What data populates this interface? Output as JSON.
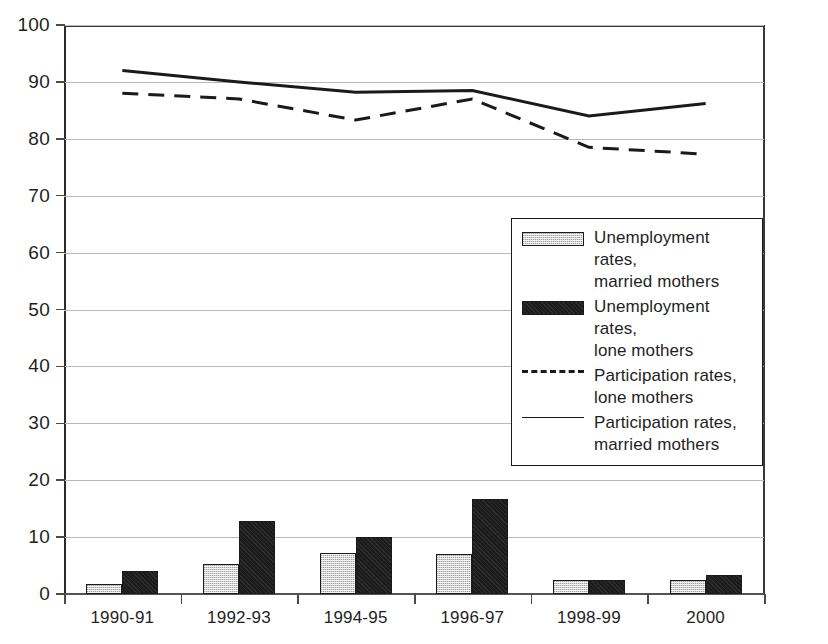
{
  "chart_data": {
    "type": "bar",
    "title": "",
    "subtitle": "",
    "xlabel": "",
    "ylabel": "",
    "ylim": [
      0,
      100
    ],
    "ytick_labels": [
      "0",
      "10",
      "20",
      "30",
      "40",
      "50",
      "60",
      "70",
      "80",
      "90",
      "100"
    ],
    "ytick_values": [
      0,
      10,
      20,
      30,
      40,
      50,
      60,
      70,
      80,
      90,
      100
    ],
    "grid": true,
    "grid_axis": "y",
    "legend_position": "center-right",
    "categories": [
      "1990-91",
      "1992-93",
      "1994-95",
      "1996-97",
      "1998-99",
      "2000"
    ],
    "series": [
      {
        "name": "Unemployment rates, married mothers",
        "kind": "bar",
        "style": "light-hatched",
        "color": "#d4d4d4",
        "values": [
          1.7,
          5.2,
          7.2,
          7.1,
          2.4,
          2.4
        ]
      },
      {
        "name": "Unemployment rates, lone mothers",
        "kind": "bar",
        "style": "solid-black",
        "color": "#1c1c1c",
        "values": [
          4.1,
          12.9,
          10.1,
          16.7,
          2.4,
          3.4
        ]
      },
      {
        "name": "Participation rates, lone mothers",
        "kind": "line",
        "style": "dashed",
        "color": "#1a1a1a",
        "values": [
          88.0,
          87.0,
          83.3,
          87.0,
          78.5,
          77.3
        ]
      },
      {
        "name": "Participation rates, married mothers",
        "kind": "line",
        "style": "solid",
        "color": "#1a1a1a",
        "values": [
          92.0,
          90.0,
          88.2,
          88.5,
          84.0,
          86.2
        ]
      }
    ]
  },
  "legend": {
    "entries": [
      {
        "label_line1": "Unemployment rates,",
        "label_line2": "married mothers",
        "marker": "swatch-light"
      },
      {
        "label_line1": "Unemployment rates,",
        "label_line2": "lone mothers",
        "marker": "swatch-dark"
      },
      {
        "label_line1": "Participation rates,",
        "label_line2": "lone mothers",
        "marker": "line-dashed"
      },
      {
        "label_line1": "Participation rates,",
        "label_line2": "married mothers",
        "marker": "line-solid"
      }
    ]
  }
}
